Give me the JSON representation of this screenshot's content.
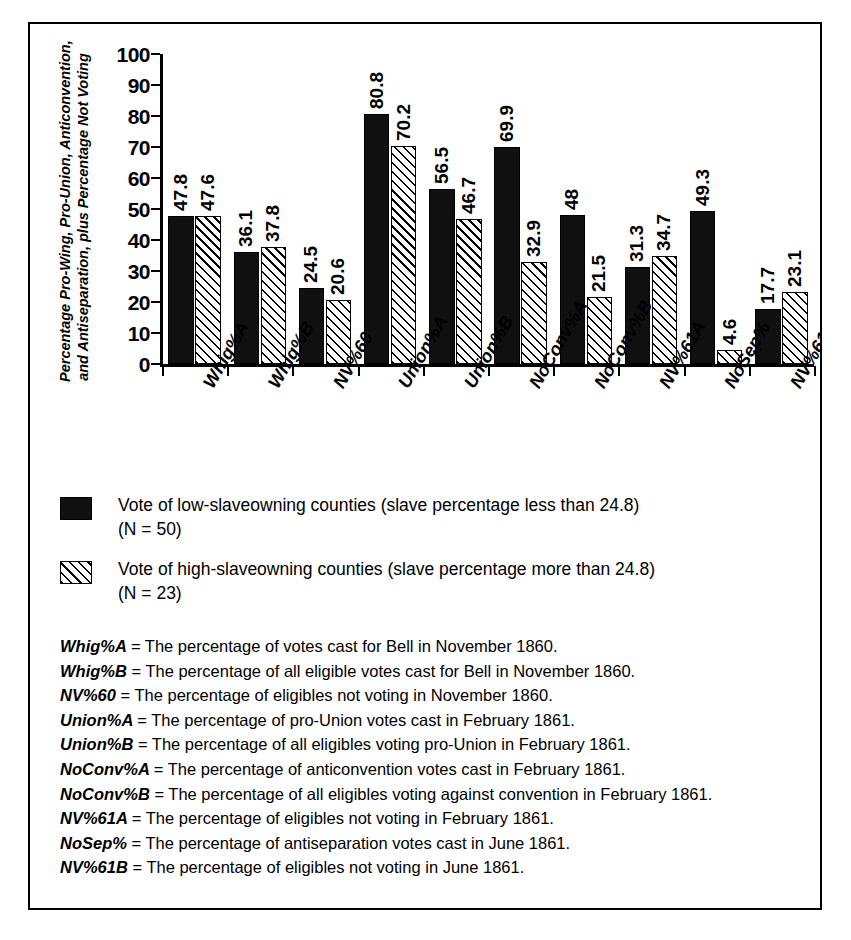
{
  "chart_data": {
    "type": "bar",
    "title": "",
    "xlabel": "",
    "ylabel": "Percentage Pro-Wing, Pro-Union, Anticonvention, and Antiseparation, plus Percentage Not Voting",
    "ylabel_line1": "Percentage Pro-Wing, Pro-Union, Anticonvention,",
    "ylabel_line2": "and Antiseparation, plus Percentage Not Voting",
    "ylim": [
      0,
      100
    ],
    "ytick_labels": [
      "0",
      "10",
      "20",
      "30",
      "40",
      "50",
      "60",
      "70",
      "80",
      "90",
      "100"
    ],
    "ytick_values": [
      0,
      10,
      20,
      30,
      40,
      50,
      60,
      70,
      80,
      90,
      100
    ],
    "grid": false,
    "legend_position": "below-plot",
    "categories": [
      "Whig%A",
      "Whig%B",
      "NV%60",
      "Union%A",
      "Union%B",
      "NoConv%A",
      "NoConv%B",
      "NV%61A",
      "NoSep%",
      "NV%61B"
    ],
    "series": [
      {
        "name": "Vote of low-slaveowning counties (slave percentage less than 24.8)",
        "style": "solid",
        "values": [
          47.8,
          36.1,
          24.5,
          80.8,
          56.5,
          69.9,
          48,
          31.3,
          49.3,
          17.7
        ],
        "labels": [
          "47.8",
          "36.1",
          "24.5",
          "80.8",
          "56.5",
          "69.9",
          "48",
          "31.3",
          "49.3",
          "17.7"
        ]
      },
      {
        "name": "Vote of high-slaveowning counties (slave percentage more than 24.8)",
        "style": "hatch",
        "values": [
          47.6,
          37.8,
          20.6,
          70.2,
          46.7,
          32.9,
          21.5,
          34.7,
          4.6,
          23.1
        ],
        "labels": [
          "47.6",
          "37.8",
          "20.6",
          "70.2",
          "46.7",
          "32.9",
          "21.5",
          "34.7",
          "4.6",
          "23.1"
        ]
      }
    ]
  },
  "legend": {
    "entries": [
      {
        "swatch": "solid-black-swatch",
        "line1": "Vote of low-slaveowning counties (slave percentage less than 24.8)",
        "line2": "(N = 50)"
      },
      {
        "swatch": "diagonal-hatch-swatch",
        "line1": "Vote of high-slaveowning counties (slave percentage more than 24.8)",
        "line2": "(N = 23)"
      }
    ]
  },
  "definitions": [
    {
      "term": "Whig%A",
      "desc": "= The percentage of votes cast for Bell  in November 1860."
    },
    {
      "term": "Whig%B",
      "desc": "= The percentage of all eligible votes cast for Bell  in November 1860."
    },
    {
      "term": "NV%60",
      "desc": "= The percentage of eligibles not voting in November 1860."
    },
    {
      "term": "Union%A",
      "desc": "= The percentage of  pro-Union votes cast in February 1861."
    },
    {
      "term": "Union%B",
      "desc": "= The percentage of all eligibles voting pro-Union in February 1861."
    },
    {
      "term": "NoConv%A",
      "desc": "= The percentage of anticonvention votes cast in February 1861."
    },
    {
      "term": "NoConv%B",
      "desc": "= The percentage of all eligibles voting against convention in February 1861."
    },
    {
      "term": "NV%61A",
      "desc": "= The percentage of eligibles not voting in February 1861."
    },
    {
      "term": "NoSep%",
      "desc": "= The percentage of antiseparation votes cast in June 1861."
    },
    {
      "term": "NV%61B",
      "desc": "= The percentage of eligibles not voting in June 1861."
    }
  ],
  "colors": {
    "series_low": "#101010",
    "series_high": "#ffffff",
    "axis": "#000000",
    "background": "#ffffff"
  }
}
